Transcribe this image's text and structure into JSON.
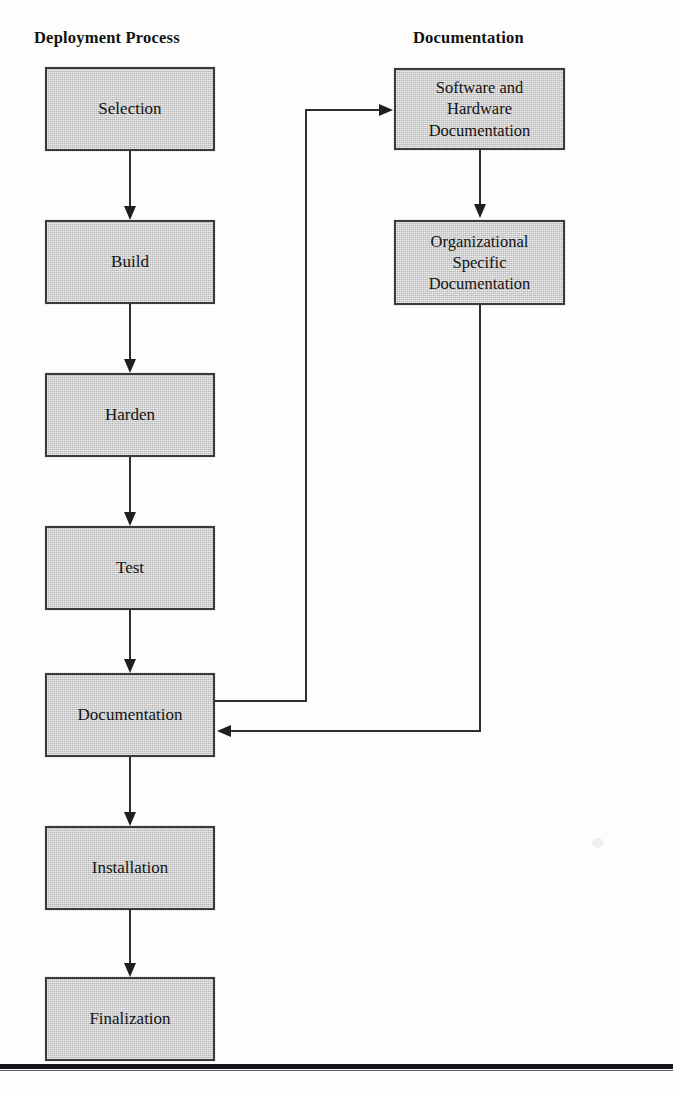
{
  "figure": {
    "columns": [
      {
        "key": "deployment",
        "heading": "Deployment Process"
      },
      {
        "key": "documentation",
        "heading": "Documentation"
      }
    ]
  },
  "deployment_nodes": [
    {
      "id": "selection",
      "label": "Selection"
    },
    {
      "id": "build",
      "label": "Build"
    },
    {
      "id": "harden",
      "label": "Harden"
    },
    {
      "id": "test",
      "label": "Test"
    },
    {
      "id": "documentation",
      "label": "Documentation"
    },
    {
      "id": "installation",
      "label": "Installation"
    },
    {
      "id": "finalization",
      "label": "Finalization"
    }
  ],
  "documentation_nodes": [
    {
      "id": "software-hardware-documentation",
      "label": "Software and\nHardware\nDocumentation"
    },
    {
      "id": "organizational-specific-documentation",
      "label": "Organizational\nSpecific\nDocumentation"
    }
  ],
  "colors": {
    "node_fill": "#c9c9c9",
    "node_border": "#3a3a3a",
    "connector": "#2e2e2e",
    "text": "#141414",
    "rule": "#15151a",
    "background": "#fdfdfc"
  }
}
